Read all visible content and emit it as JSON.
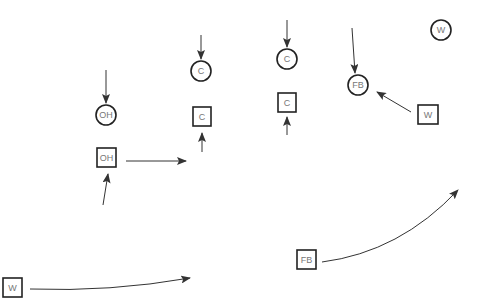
{
  "diagram": {
    "type": "play-diagram",
    "colors": {
      "line": "#333333",
      "shape_stroke": "#222222",
      "label": "#777777",
      "background": "#ffffff"
    },
    "circles": [
      {
        "id": "oh-circle",
        "label": "OH",
        "cx": 106,
        "cy": 115
      },
      {
        "id": "c-circle-left",
        "label": "C",
        "cx": 201,
        "cy": 71
      },
      {
        "id": "c-circle-right",
        "label": "C",
        "cx": 287,
        "cy": 59
      },
      {
        "id": "fb-circle",
        "label": "FB",
        "cx": 358,
        "cy": 85
      },
      {
        "id": "w-circle",
        "label": "W",
        "cx": 441,
        "cy": 30
      }
    ],
    "squares": [
      {
        "id": "oh-square",
        "label": "OH",
        "x": 97,
        "y": 148
      },
      {
        "id": "c-square-left",
        "label": "C",
        "x": 193,
        "y": 107
      },
      {
        "id": "c-square-right",
        "label": "C",
        "x": 278,
        "y": 93
      },
      {
        "id": "w-square-right",
        "label": "W",
        "x": 418,
        "y": 105
      },
      {
        "id": "w-square-left",
        "label": "W",
        "x": 3,
        "y": 278
      },
      {
        "id": "fb-square",
        "label": "FB",
        "x": 297,
        "y": 250
      }
    ]
  }
}
